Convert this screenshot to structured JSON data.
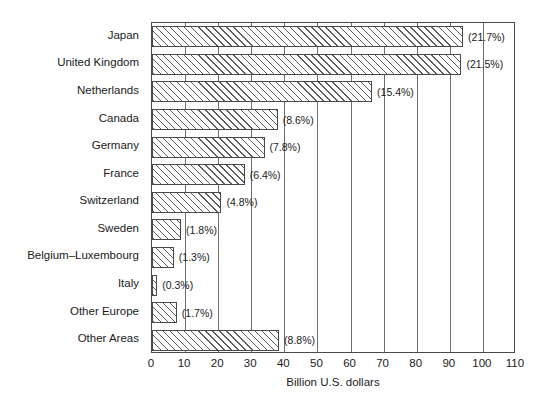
{
  "chart_data": {
    "type": "bar",
    "orientation": "horizontal",
    "title": "",
    "xlabel": "Billion U.S. dollars",
    "ylabel": "",
    "xlim": [
      0,
      110
    ],
    "xticks": [
      0,
      10,
      20,
      30,
      40,
      50,
      60,
      70,
      80,
      90,
      100,
      110
    ],
    "grid": "vertical",
    "legend": "none",
    "categories": [
      "Japan",
      "United Kingdom",
      "Netherlands",
      "Canada",
      "Germany",
      "France",
      "Switzerland",
      "Sweden",
      "Belgium–Luxembourg",
      "Italy",
      "Other Europe",
      "Other Areas"
    ],
    "values": [
      94.0,
      93.5,
      66.5,
      38.0,
      34.0,
      28.0,
      21.0,
      8.8,
      6.6,
      1.6,
      7.5,
      38.4
    ],
    "annotations": [
      "(21.7%)",
      "(21.5%)",
      "(15.4%)",
      "(8.6%)",
      "(7.8%)",
      "(6.4%)",
      "(4.8%)",
      "(1.8%)",
      "(1.3%)",
      "(0.3%)",
      "(1.7%)",
      "(8.8%)"
    ],
    "series": [
      {
        "name": "Billion U.S. dollars",
        "values": [
          94.0,
          93.5,
          66.5,
          38.0,
          34.0,
          28.0,
          21.0,
          8.8,
          6.6,
          1.6,
          7.5,
          38.4
        ]
      }
    ],
    "colors": {
      "bar_fill": "#ffffff",
      "bar_hatch": "#5d5d5d",
      "bar_edge": "#4a4a4a",
      "gridline": "#6e6e6e",
      "axis": "#4a4a4a",
      "text": "#1a1a1a",
      "background": "#ffffff"
    }
  }
}
